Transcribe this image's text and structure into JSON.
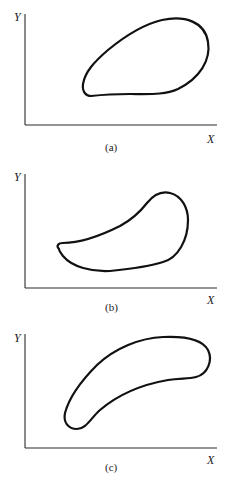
{
  "figure": {
    "panels": [
      {
        "id": "a",
        "caption": "(a)",
        "x_label": "X",
        "y_label": "Y",
        "shape": "teardrop closed contour, narrow end at lower-left, wide rounded end at upper-right"
      },
      {
        "id": "b",
        "caption": "(b)",
        "x_label": "X",
        "y_label": "Y",
        "shape": "comma/kidney closed contour, pointed tip at left, bulbous end at upper-right"
      },
      {
        "id": "c",
        "caption": "(c)",
        "x_label": "X",
        "y_label": "Y",
        "shape": "banana-shaped closed contour curving from lower-left up to upper-right"
      }
    ]
  }
}
